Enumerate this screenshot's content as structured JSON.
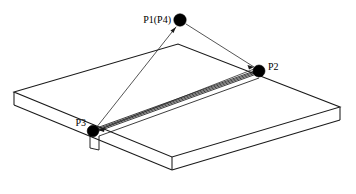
{
  "figure": {
    "background_color": "#ffffff",
    "line_color": "#1a1a1a",
    "dot_color": "#000000",
    "width": 356,
    "height": 194
  },
  "points": [
    {
      "id": "p1",
      "label": "P1(P4)",
      "dot_x": 180,
      "dot_y": 20,
      "dot_r": 6.2,
      "label_x": 171,
      "label_y": 23,
      "anchor": "end"
    },
    {
      "id": "p2",
      "label": "P2",
      "dot_x": 259,
      "dot_y": 71,
      "dot_r": 6.0,
      "label_x": 268,
      "label_y": 70,
      "anchor": "start"
    },
    {
      "id": "p3",
      "label": "P3",
      "dot_x": 93,
      "dot_y": 131,
      "dot_r": 5.8,
      "label_x": 86,
      "label_y": 126,
      "anchor": "end"
    }
  ],
  "connections": [
    {
      "id": "p3-to-p1",
      "from": "P3",
      "to": "P1(P4)",
      "x1": 96,
      "y1": 128,
      "x2": 176,
      "y2": 27,
      "arrow_at": "P1(P4)"
    },
    {
      "id": "p1-to-p2",
      "from": "P1(P4)",
      "to": "P2",
      "x1": 186,
      "y1": 24,
      "x2": 254,
      "y2": 67,
      "arrow_at": "P2"
    },
    {
      "id": "p2-to-p3",
      "from": "P2",
      "to": "P3",
      "x1": 254,
      "y1": 70,
      "x2": 98,
      "y2": 130,
      "arrow_at": "P3"
    }
  ],
  "plate": {
    "name": "rectangular-plate",
    "top_face": "14,92 178,44 340,107 172,157",
    "front_left_face": "14,92 14,105 172,170 172,157",
    "front_right_face": "172,157 172,170 340,120 340,107",
    "back_left_edge": "14,92 178,44",
    "back_right_edge": "178,44 340,107",
    "right_vertical_edge": "340,107 340,120",
    "left_vertical_edge": "14,92 14,105",
    "front_vertex_vertical": "172,157 172,170",
    "bottom_left_edge": "14,105 172,170",
    "bottom_right_edge": "172,170 340,120"
  },
  "groove": {
    "name": "weld-groove-seam",
    "start_x": 93,
    "start_y": 131,
    "end_x": 259,
    "end_y": 71,
    "line_count": 4,
    "offsets": [
      -1.8,
      -0.6,
      0.7,
      2.0
    ],
    "description": "narrow parallel-line band running from P3 to P2"
  },
  "notch": {
    "name": "edge-notch",
    "vertical_1": "90,133 90,148",
    "vertical_2": "99,136 99,150",
    "bottom_connector": "90,148 99,150"
  },
  "groove_back_edge": {
    "name": "groove-inner-back-edge",
    "path": "99,136 259,78"
  }
}
